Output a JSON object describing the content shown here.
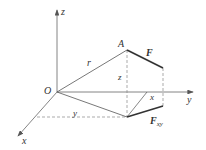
{
  "figure": {
    "labels": {
      "z_axis": "z",
      "y_axis": "y",
      "x_axis": "x",
      "origin": "O",
      "point_A": "A",
      "force": "F",
      "force_xy_main": "F",
      "force_xy_sub": "xy",
      "r": "r",
      "z_height": "z",
      "x_comp": "x",
      "y_comp": "y"
    },
    "colors": {
      "line": "#555555",
      "dashed": "#777777",
      "vector": "#333333"
    }
  }
}
